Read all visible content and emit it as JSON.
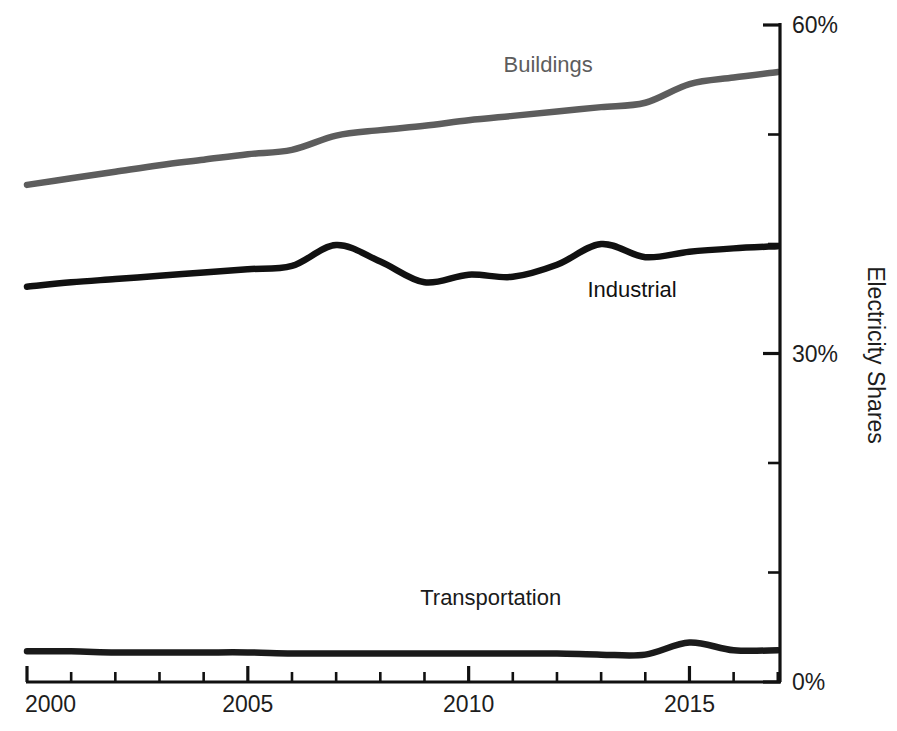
{
  "chart_data": {
    "type": "line",
    "title": "",
    "subtitle": "",
    "xlabel": "",
    "ylabel": "Electricity Shares",
    "xlim": [
      2000,
      2017.05
    ],
    "ylim": [
      0,
      60
    ],
    "grid": false,
    "legend_position": "inline-labels",
    "y_tick_labels": [
      "60%",
      "30%",
      "0%"
    ],
    "y_tick_values": [
      60,
      30,
      0
    ],
    "y_minor_tick_values": [
      50,
      40,
      20,
      10
    ],
    "x_tick_labels": [
      "2000",
      "2005",
      "2010",
      "2015"
    ],
    "x_tick_values": [
      2000,
      2005,
      2010,
      2015
    ],
    "x_minor_tick_values": [
      2001,
      2002,
      2003,
      2004,
      2006,
      2007,
      2008,
      2009,
      2011,
      2012,
      2013,
      2014,
      2016,
      2017
    ],
    "x": [
      2000,
      2001,
      2002,
      2003,
      2004,
      2005,
      2006,
      2007,
      2008,
      2009,
      2010,
      2011,
      2012,
      2013,
      2014,
      2015,
      2016,
      2017
    ],
    "series": [
      {
        "name": "Buildings",
        "color": "#5d5d5d",
        "label_x": 2011.8,
        "label_y": 55.7,
        "values": [
          45.4,
          46.0,
          46.6,
          47.2,
          47.7,
          48.2,
          48.6,
          49.9,
          50.4,
          50.8,
          51.3,
          51.7,
          52.1,
          52.5,
          52.9,
          54.6,
          55.2,
          55.7
        ]
      },
      {
        "name": "Industrial",
        "color": "#111111",
        "label_x": 2013.7,
        "label_y": 35.2,
        "values": [
          36.1,
          36.5,
          36.8,
          37.1,
          37.4,
          37.7,
          38.0,
          39.9,
          38.4,
          36.5,
          37.2,
          37.0,
          38.1,
          40.0,
          38.8,
          39.3,
          39.6,
          39.8
        ]
      },
      {
        "name": "Transportation",
        "color": "#1a1a1a",
        "label_x": 2010.5,
        "label_y": 7.0,
        "values": [
          2.8,
          2.8,
          2.7,
          2.7,
          2.7,
          2.7,
          2.6,
          2.6,
          2.6,
          2.6,
          2.6,
          2.6,
          2.6,
          2.5,
          2.5,
          3.6,
          2.9,
          2.9
        ]
      }
    ]
  },
  "footer": {
    "caption_fragment": ""
  }
}
